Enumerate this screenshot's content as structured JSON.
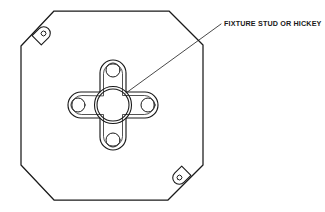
{
  "figure": {
    "background_color": "#ffffff",
    "line_color": "#1a1a1a",
    "width": 325,
    "height": 212
  },
  "callouts": [
    {
      "id": "fixture-stud",
      "label": "FIXTURE STUD OR HICKEY",
      "text_x": 224,
      "text_y": 26,
      "leader": {
        "from_x": 221,
        "from_y": 24,
        "to_x": 126,
        "to_y": 93
      }
    }
  ],
  "box": {
    "name": "octagonal-outlet-box",
    "shape": "octagon",
    "vertices": [
      [
        54,
        11
      ],
      [
        169,
        11
      ],
      [
        203,
        45
      ],
      [
        203,
        165
      ],
      [
        168,
        200
      ],
      [
        54,
        200
      ],
      [
        21,
        165
      ],
      [
        21,
        46
      ]
    ]
  },
  "mounting_tabs": [
    {
      "name": "mounting-tab-top-left",
      "hole_x": 45,
      "hole_y": 38,
      "hole_r": 2.4,
      "rotation": -45
    },
    {
      "name": "mounting-tab-bottom-right",
      "hole_x": 178,
      "hole_y": 173,
      "hole_r": 2.4,
      "rotation": 135
    }
  ],
  "fixture_strap": {
    "name": "cross-fixture-strap",
    "center_x": 113,
    "center_y": 105,
    "arm_length": 45,
    "arm_half_width": 13,
    "hub_outer_r": 18.5,
    "hub_inner_r": 16.0,
    "arm_holes": [
      {
        "name": "strap-hole-top",
        "cx": 113,
        "cy": 70,
        "r": 7.0
      },
      {
        "name": "strap-hole-right",
        "cx": 148,
        "cy": 105,
        "r": 7.0
      },
      {
        "name": "strap-hole-bottom",
        "cx": 113,
        "cy": 140,
        "r": 7.0
      },
      {
        "name": "strap-hole-left",
        "cx": 78,
        "cy": 105,
        "r": 7.0
      }
    ]
  }
}
